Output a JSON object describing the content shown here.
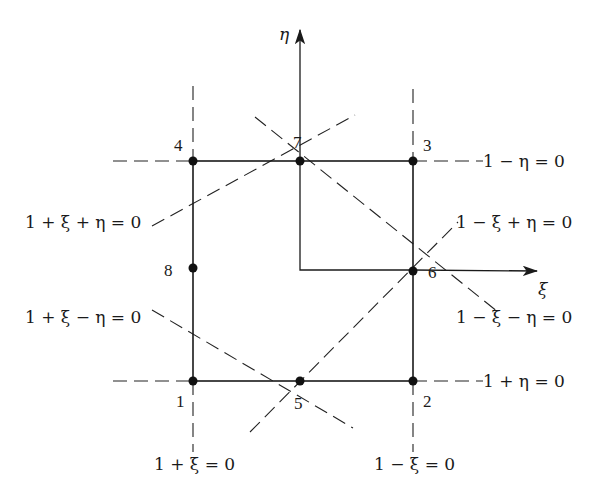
{
  "diagram": {
    "type": "eight-node quadratic serendipity element, natural coordinates",
    "axes": {
      "horizontal": "ξ",
      "vertical": "η"
    },
    "nodes": [
      {
        "id": "1",
        "label": "1"
      },
      {
        "id": "2",
        "label": "2"
      },
      {
        "id": "3",
        "label": "3"
      },
      {
        "id": "4",
        "label": "4"
      },
      {
        "id": "5",
        "label": "5"
      },
      {
        "id": "6",
        "label": "6"
      },
      {
        "id": "7",
        "label": "7"
      },
      {
        "id": "8",
        "label": "8"
      }
    ],
    "line_equations": {
      "top": "1 − η = 0",
      "bottom": "1 + η = 0",
      "left": "1 + ξ = 0",
      "right": "1 − ξ = 0",
      "diag_upper_left": "1 + ξ + η = 0",
      "diag_lower_left": "1 + ξ − η = 0",
      "diag_upper_right": "1 − ξ + η = 0",
      "diag_lower_right": "1 − ξ − η = 0"
    }
  }
}
